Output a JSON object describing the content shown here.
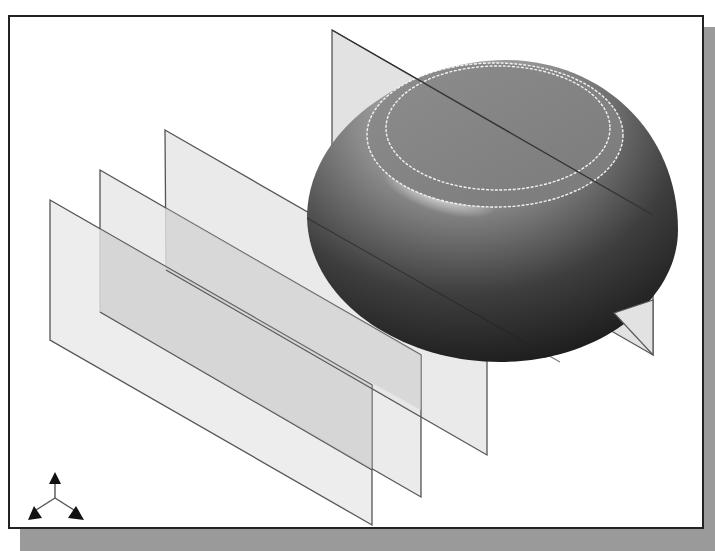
{
  "viewport": {
    "background": "#ffffff",
    "frame_color": "#222222",
    "shadow_color": "#9a9a9a"
  },
  "model": {
    "body": "revolved bowl / dome solid",
    "planes": [
      {
        "name": "datum-plane-1",
        "fill": "#e4e4e4"
      },
      {
        "name": "datum-plane-2",
        "fill": "#e4e4e4"
      },
      {
        "name": "datum-plane-3",
        "fill": "#e4e4e4"
      },
      {
        "name": "datum-plane-4",
        "fill": "#e4e4e4"
      }
    ],
    "edge_color": "#555555",
    "highlight_edges": "#f4f4f4"
  },
  "triad": {
    "icon": "view-orientation-triad-icon"
  }
}
